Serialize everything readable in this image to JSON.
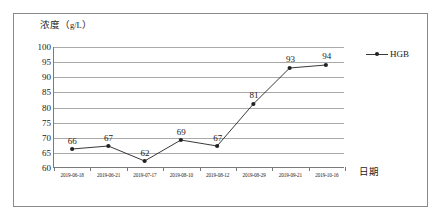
{
  "chart_data": {
    "type": "line",
    "title": "",
    "ylabel": "浓度（g/L）",
    "ylabel_main": "浓度（",
    "ylabel_unit": "g/L",
    "ylabel_close": "）",
    "xlabel": "日期",
    "categories": [
      "2019-06-18",
      "2019-06-21",
      "2019-07-17",
      "2019-08-10",
      "2019-08-12",
      "2019-08-29",
      "2019-09-21",
      "2019-10-16"
    ],
    "series": [
      {
        "name": "HGB",
        "values": [
          66,
          67,
          62,
          69,
          67,
          81,
          93,
          94
        ],
        "color": "#222222"
      }
    ],
    "point_labels": [
      "66",
      "67",
      "62",
      "69",
      "67",
      "81",
      "93",
      "94"
    ],
    "ylim": [
      60,
      100
    ],
    "ytick_step": 5,
    "yticks": [
      "100",
      "95",
      "90",
      "85",
      "80",
      "75",
      "70",
      "65",
      "60"
    ],
    "grid": true,
    "legend_position": "top-right"
  },
  "legend": {
    "entries": [
      {
        "label": "HGB",
        "color": "#222222"
      }
    ]
  }
}
